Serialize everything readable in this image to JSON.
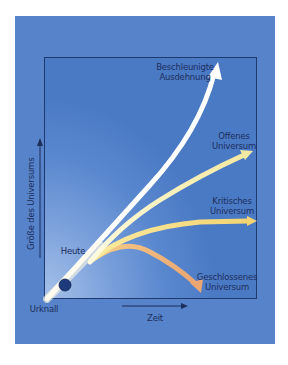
{
  "diagram": {
    "title": "",
    "axes": {
      "y_label": "Größe des Universums",
      "x_label": "Zeit",
      "origin_label": "Urknall"
    },
    "markers": {
      "today_label": "Heute"
    },
    "curves": [
      {
        "id": "accelerating",
        "line1": "Beschleunigte",
        "line2": "Ausdehnung",
        "color": "#ffffff"
      },
      {
        "id": "open",
        "line1": "Offenes",
        "line2": "Universum",
        "color": "#f6eca8"
      },
      {
        "id": "critical",
        "line1": "Kritisches",
        "line2": "Universum",
        "color": "#f3d77c"
      },
      {
        "id": "closed",
        "line1": "Geschlossenes",
        "line2": "Universum",
        "color": "#eeb27a"
      }
    ],
    "colors": {
      "panel": "#5683c9",
      "frame_border": "#1e3a6e",
      "text": "#1c2f5e",
      "today_dot": "#1d3a7a"
    }
  }
}
